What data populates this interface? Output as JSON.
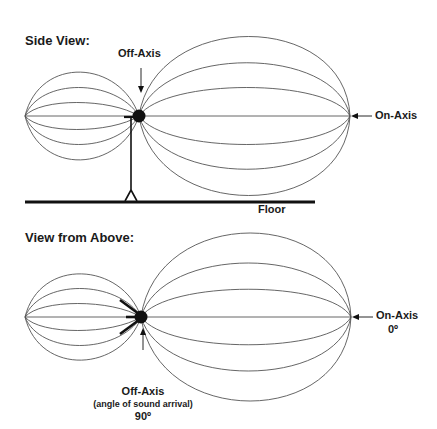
{
  "side_view": {
    "title": "Side View:",
    "off_axis_label": "Off-Axis",
    "on_axis_label": "On-Axis",
    "floor_label": "Floor"
  },
  "top_view": {
    "title": "View from Above:",
    "on_axis_label": "On-Axis",
    "on_axis_angle": "0º",
    "off_axis_label": "Off-Axis",
    "off_axis_note": "(angle of sound arrival)",
    "off_axis_angle": "90º"
  },
  "colors": {
    "line": "#555555",
    "ink": "#111111",
    "background": "#ffffff"
  }
}
